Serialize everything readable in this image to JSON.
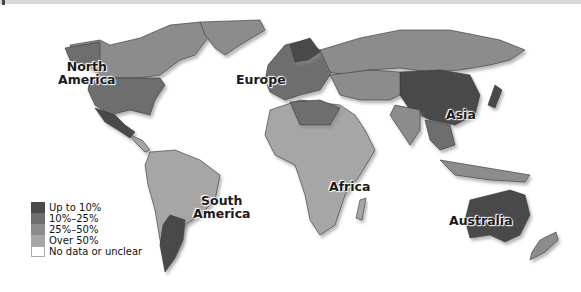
{
  "map": {
    "type": "choropleth",
    "continent_labels": [
      {
        "id": "north-america",
        "line1": "North",
        "line2": "America"
      },
      {
        "id": "europe",
        "line1": "Europe"
      },
      {
        "id": "asia",
        "line1": "Asia"
      },
      {
        "id": "south-america",
        "line1": "South",
        "line2": "America"
      },
      {
        "id": "africa",
        "line1": "Africa"
      },
      {
        "id": "australia",
        "line1": "Australia"
      }
    ]
  },
  "legend": {
    "items": [
      {
        "label": "Up to 10%",
        "color": "#4a4a4a"
      },
      {
        "label": "10%–25%",
        "color": "#6e6e6e"
      },
      {
        "label": "25%–50%",
        "color": "#8c8c8c"
      },
      {
        "label": "Over 50%",
        "color": "#a6a6a6"
      },
      {
        "label": "No data or unclear",
        "color": "#ffffff"
      }
    ]
  }
}
